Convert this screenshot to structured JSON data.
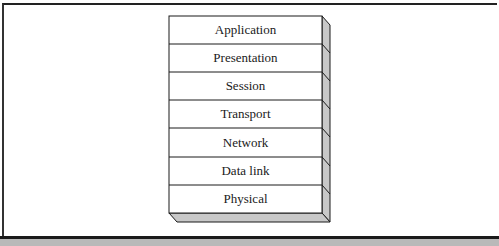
{
  "diagram": {
    "layers": [
      {
        "label": "Application"
      },
      {
        "label": "Presentation"
      },
      {
        "label": "Session"
      },
      {
        "label": "Transport"
      },
      {
        "label": "Network"
      },
      {
        "label": "Data link"
      },
      {
        "label": "Physical"
      }
    ],
    "colors": {
      "face": "#ffffff",
      "side": "#c8c8c8",
      "stroke": "#1a1a1a",
      "footer_bar": "#b9b9b9"
    }
  }
}
